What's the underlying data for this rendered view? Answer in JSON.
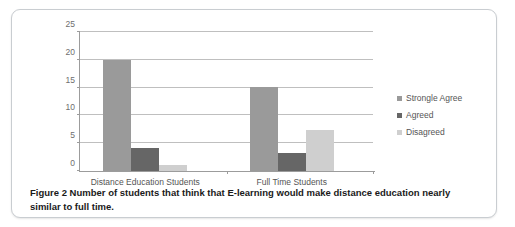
{
  "figure": {
    "caption_label": "Figure 2",
    "caption_text": " Number of students that think that E-learning would make distance education nearly similar to full time."
  },
  "colors": {
    "series_strongly_agree": "#9a9a9a",
    "series_agreed": "#666666",
    "series_disagreed": "#cfcfcf",
    "gridline": "#bfbfbf",
    "axis": "#9c9c9c",
    "tick_text": "#6e6e6e",
    "category_text": "#555555",
    "card_border": "#c9cdd1",
    "background": "#ffffff"
  },
  "chart_data": {
    "type": "bar",
    "title": "",
    "xlabel": "",
    "ylabel": "",
    "ylim": [
      0,
      25
    ],
    "yticks": [
      0,
      5,
      10,
      15,
      20,
      25
    ],
    "ytick_labels": [
      "0",
      "5",
      "10",
      "15",
      "20",
      "25"
    ],
    "grid": true,
    "grid_axis": "y",
    "legend_position": "right",
    "categories": [
      "Distance Education Students",
      "Full Time Students"
    ],
    "series": [
      {
        "name": "Strongle Agree",
        "color": "#9a9a9a",
        "values": [
          20,
          15.2
        ]
      },
      {
        "name": "Agreed",
        "color": "#666666",
        "values": [
          4.2,
          3.3
        ]
      },
      {
        "name": "Disagreed",
        "color": "#cfcfcf",
        "values": [
          1.0,
          7.3
        ]
      }
    ]
  }
}
